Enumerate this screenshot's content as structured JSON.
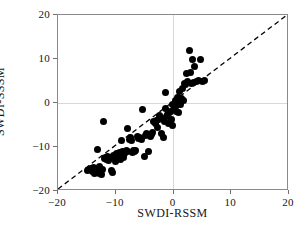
{
  "chart_data": {
    "type": "scatter",
    "title": "",
    "xlabel": "SWDI-RSSM",
    "ylabel": "SWDI-SSSM",
    "xlim": [
      -20,
      20
    ],
    "ylim": [
      -20,
      20
    ],
    "xticks": [
      -20,
      -10,
      0,
      10,
      20
    ],
    "yticks": [
      -20,
      -10,
      0,
      10,
      20
    ],
    "xticklabels": [
      "−20",
      "−10",
      "0",
      "10",
      "20"
    ],
    "yticklabels": [
      "−20",
      "−10",
      "0",
      "10",
      "20"
    ],
    "grid": true,
    "grid_color": "#d8d8d8",
    "legend": null,
    "marker_color": "#000000",
    "marker_size": 7,
    "reference_line": {
      "name": "1:1 identity line",
      "style": "dashed",
      "color": "#000000",
      "from": [
        -20,
        -20
      ],
      "to": [
        20,
        20
      ]
    },
    "points": [
      [
        -14.9,
        -15.4
      ],
      [
        -14.6,
        -15.1
      ],
      [
        -14.3,
        -14.9
      ],
      [
        -14.1,
        -15.6
      ],
      [
        -13.9,
        -14.6
      ],
      [
        -13.7,
        -15.3
      ],
      [
        -13.6,
        -16.0
      ],
      [
        -13.4,
        -14.8
      ],
      [
        -13.3,
        -15.9
      ],
      [
        -13.2,
        -10.6
      ],
      [
        -13.0,
        -15.2
      ],
      [
        -12.9,
        -16.1
      ],
      [
        -12.8,
        -14.4
      ],
      [
        -12.6,
        -15.7
      ],
      [
        -12.4,
        -16.3
      ],
      [
        -12.3,
        -15.0
      ],
      [
        -12.1,
        -4.3
      ],
      [
        -12.0,
        -12.6
      ],
      [
        -11.8,
        -12.3
      ],
      [
        -11.6,
        -12.9
      ],
      [
        -11.4,
        -12.1
      ],
      [
        -11.2,
        -13.1
      ],
      [
        -11.0,
        -12.5
      ],
      [
        -10.8,
        -15.4
      ],
      [
        -10.6,
        -15.8
      ],
      [
        -10.4,
        -11.9
      ],
      [
        -10.2,
        -12.4
      ],
      [
        -10.0,
        -13.3
      ],
      [
        -9.8,
        -11.5
      ],
      [
        -9.6,
        -12.0
      ],
      [
        -9.4,
        -11.2
      ],
      [
        -9.2,
        -12.8
      ],
      [
        -9.0,
        -8.6
      ],
      [
        -8.8,
        -11.1
      ],
      [
        -8.6,
        -12.4
      ],
      [
        -8.4,
        -11.4
      ],
      [
        -8.2,
        -10.9
      ],
      [
        -8.0,
        -5.9
      ],
      [
        -7.9,
        -11.0
      ],
      [
        -7.7,
        -8.2
      ],
      [
        -7.5,
        -7.9
      ],
      [
        -7.3,
        -8.5
      ],
      [
        -7.1,
        -11.2
      ],
      [
        -6.9,
        -10.8
      ],
      [
        -6.7,
        -11.0
      ],
      [
        -6.5,
        -10.9
      ],
      [
        -6.3,
        -7.6
      ],
      [
        -6.1,
        -8.0
      ],
      [
        -5.9,
        -7.9
      ],
      [
        -5.6,
        -8.3
      ],
      [
        -5.3,
        -1.5
      ],
      [
        -5.0,
        -12.2
      ],
      [
        -4.8,
        -7.3
      ],
      [
        -4.6,
        -7.0
      ],
      [
        -4.4,
        -11.0
      ],
      [
        -4.2,
        -7.2
      ],
      [
        -4.0,
        -7.5
      ],
      [
        -3.8,
        -7.1
      ],
      [
        -3.6,
        -6.8
      ],
      [
        -3.4,
        -4.3
      ],
      [
        -3.2,
        -4.6
      ],
      [
        -3.0,
        -4.0
      ],
      [
        -2.8,
        -5.6
      ],
      [
        -2.6,
        -3.7
      ],
      [
        -2.4,
        -2.9
      ],
      [
        -2.2,
        -3.4
      ],
      [
        -2.0,
        -6.9
      ],
      [
        -1.8,
        -7.8
      ],
      [
        -1.6,
        -4.2
      ],
      [
        -1.4,
        -1.2
      ],
      [
        -1.2,
        -3.1
      ],
      [
        -1.1,
        -2.6
      ],
      [
        -0.9,
        -4.6
      ],
      [
        -0.7,
        -2.2
      ],
      [
        -0.5,
        -1.9
      ],
      [
        -0.3,
        -3.8
      ],
      [
        -0.1,
        -0.4
      ],
      [
        0.1,
        -1.1
      ],
      [
        0.3,
        0.6
      ],
      [
        0.5,
        -0.6
      ],
      [
        0.7,
        1.2
      ],
      [
        0.9,
        0.3
      ],
      [
        1.1,
        2.6
      ],
      [
        1.3,
        1.0
      ],
      [
        1.5,
        3.4
      ],
      [
        1.7,
        0.5
      ],
      [
        1.9,
        4.4
      ],
      [
        2.1,
        4.1
      ],
      [
        2.3,
        6.8
      ],
      [
        2.5,
        5.0
      ],
      [
        2.7,
        11.9
      ],
      [
        2.9,
        7.0
      ],
      [
        3.1,
        4.5
      ],
      [
        3.3,
        9.9
      ],
      [
        3.5,
        4.6
      ],
      [
        3.7,
        8.2
      ],
      [
        4.0,
        4.8
      ],
      [
        4.3,
        5.1
      ],
      [
        4.6,
        9.8
      ],
      [
        5.0,
        4.9
      ],
      [
        5.4,
        5.2
      ],
      [
        -1.4,
        2.5
      ],
      [
        0.6,
        -2.0
      ],
      [
        0.9,
        -2.1
      ],
      [
        -0.2,
        -5.2
      ],
      [
        1.2,
        -0.3
      ]
    ]
  }
}
